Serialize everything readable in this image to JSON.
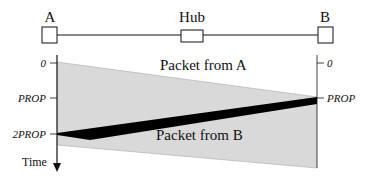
{
  "diagram": {
    "nodes": [
      {
        "id": "A",
        "label": "A"
      },
      {
        "id": "Hub",
        "label": "Hub"
      },
      {
        "id": "B",
        "label": "B"
      }
    ],
    "left_axis_ticks": [
      "0",
      "PROP",
      "2PROP"
    ],
    "right_axis_ticks": [
      "0",
      "PROP"
    ],
    "time_label": "Time",
    "regions": {
      "packet_a_label": "Packet from A",
      "packet_b_label": "Packet from B"
    },
    "colors": {
      "region_fill": "#d9d9d9",
      "collision_fill": "#000000",
      "line": "#111111"
    }
  }
}
